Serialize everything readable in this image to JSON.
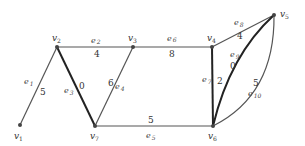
{
  "graph": {
    "vertices": [
      {
        "id": "v1",
        "label": "v",
        "sub": "1",
        "x": 20,
        "y": 125
      },
      {
        "id": "v2",
        "label": "v",
        "sub": "2",
        "x": 57,
        "y": 47
      },
      {
        "id": "v3",
        "label": "v",
        "sub": "3",
        "x": 133,
        "y": 47
      },
      {
        "id": "v4",
        "label": "v",
        "sub": "4",
        "x": 212,
        "y": 47
      },
      {
        "id": "v5",
        "label": "v",
        "sub": "5",
        "x": 274,
        "y": 15
      },
      {
        "id": "v6",
        "label": "v",
        "sub": "6",
        "x": 213,
        "y": 126
      },
      {
        "id": "v7",
        "label": "v",
        "sub": "7",
        "x": 95,
        "y": 126
      }
    ],
    "edges": [
      {
        "id": "e1",
        "label": "e",
        "sub": "1",
        "from": "v1",
        "to": "v2",
        "weight": "5",
        "bold": false
      },
      {
        "id": "e2",
        "label": "e",
        "sub": "2",
        "from": "v2",
        "to": "v3",
        "weight": "4",
        "bold": false
      },
      {
        "id": "e3",
        "label": "e",
        "sub": "3",
        "from": "v2",
        "to": "v7",
        "weight": "0",
        "bold": true
      },
      {
        "id": "e4",
        "label": "e",
        "sub": "4",
        "from": "v3",
        "to": "v7",
        "weight": "6",
        "bold": false
      },
      {
        "id": "e5",
        "label": "e",
        "sub": "5",
        "from": "v7",
        "to": "v6",
        "weight": "5",
        "bold": false
      },
      {
        "id": "e6",
        "label": "e",
        "sub": "6",
        "from": "v3",
        "to": "v4",
        "weight": "8",
        "bold": false
      },
      {
        "id": "e7",
        "label": "e",
        "sub": "7",
        "from": "v4",
        "to": "v6",
        "weight": "2",
        "bold": true
      },
      {
        "id": "e8",
        "label": "e",
        "sub": "8",
        "from": "v4",
        "to": "v5",
        "weight": "4",
        "bold": false
      },
      {
        "id": "e9",
        "label": "e",
        "sub": "9",
        "from": "v6",
        "to": "v5",
        "weight": "0",
        "bold": true
      },
      {
        "id": "e10",
        "label": "e",
        "sub": "10",
        "from": "v6",
        "to": "v5",
        "weight": "5",
        "bold": false
      }
    ]
  }
}
